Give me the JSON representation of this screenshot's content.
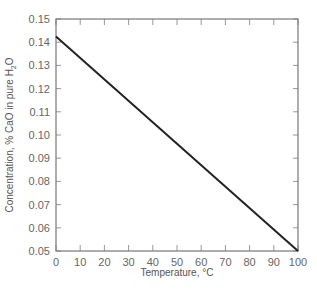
{
  "chart_data": {
    "type": "line",
    "title": "",
    "xlabel": "Temperature, °C",
    "ylabel": "Concentration, % CaO in pure H2O",
    "ylabel_parts": {
      "main": "Concentration, % CaO in pure H",
      "sub": "2",
      "tail": "O"
    },
    "xlim": [
      0,
      100
    ],
    "ylim": [
      0.05,
      0.15
    ],
    "xticks": [
      "0",
      "10",
      "20",
      "30",
      "40",
      "50",
      "60",
      "70",
      "80",
      "90",
      "100"
    ],
    "yticks": [
      "0.05",
      "0.06",
      "0.07",
      "0.08",
      "0.09",
      "0.10",
      "0.11",
      "0.12",
      "0.13",
      "0.14",
      "0.15"
    ],
    "grid": false,
    "legend": null,
    "series": [
      {
        "name": "CaO solubility",
        "x": [
          0,
          100
        ],
        "values": [
          0.1425,
          0.05
        ],
        "color": "#222222"
      }
    ]
  }
}
